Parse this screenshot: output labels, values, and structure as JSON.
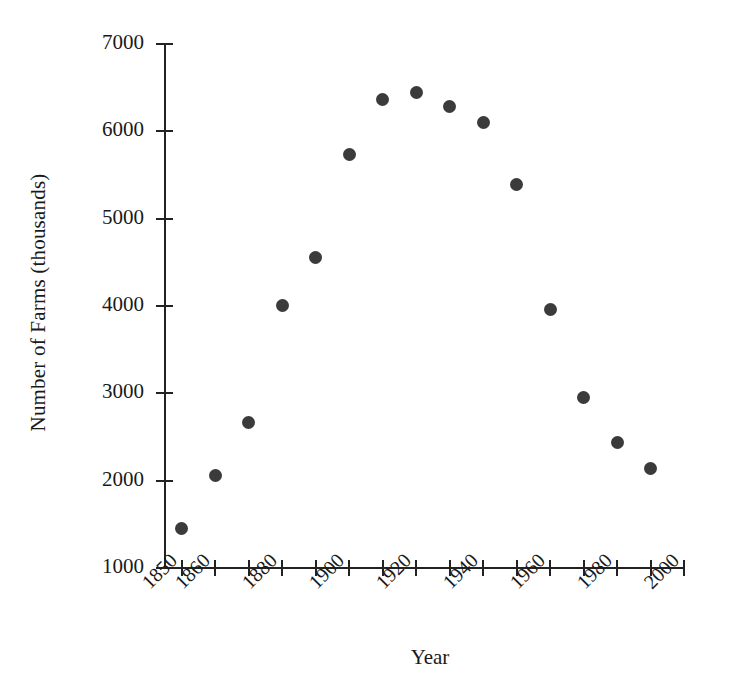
{
  "chart_data": {
    "type": "scatter",
    "title": "",
    "xlabel": "Year",
    "ylabel": "Number of Farms (thousands)",
    "xlim": [
      1845,
      2000
    ],
    "ylim": [
      1000,
      7000
    ],
    "grid": false,
    "legend": "none",
    "marker_color": "#3b3b3b",
    "axis_color": "#222222",
    "background_color": "#ffffff",
    "x": [
      1850,
      1860,
      1870,
      1880,
      1890,
      1900,
      1910,
      1920,
      1930,
      1940,
      1950,
      1960,
      1970,
      1980,
      1990
    ],
    "values": [
      1450,
      2060,
      2670,
      4010,
      4560,
      5740,
      6370,
      6450,
      6290,
      6100,
      5390,
      3960,
      2950,
      2440,
      2140
    ],
    "series": [
      {
        "name": "Number of Farms",
        "values": [
          1450,
          2060,
          2670,
          4010,
          4560,
          5740,
          6370,
          6450,
          6290,
          6100,
          5390,
          3960,
          2950,
          2440,
          2140
        ]
      }
    ],
    "points": [
      {
        "year": 1850,
        "farms": 1450
      },
      {
        "year": 1860,
        "farms": 2060
      },
      {
        "year": 1870,
        "farms": 2670
      },
      {
        "year": 1880,
        "farms": 4010
      },
      {
        "year": 1890,
        "farms": 4560
      },
      {
        "year": 1900,
        "farms": 5740
      },
      {
        "year": 1910,
        "farms": 6370
      },
      {
        "year": 1920,
        "farms": 6450
      },
      {
        "year": 1930,
        "farms": 6290
      },
      {
        "year": 1940,
        "farms": 6100
      },
      {
        "year": 1950,
        "farms": 5390
      },
      {
        "year": 1960,
        "farms": 3960
      },
      {
        "year": 1970,
        "farms": 2950
      },
      {
        "year": 1980,
        "farms": 2440
      },
      {
        "year": 1990,
        "farms": 2140
      }
    ],
    "yticks": [
      {
        "value": 7000,
        "label": "7000"
      },
      {
        "value": 6000,
        "label": "6000"
      },
      {
        "value": 5000,
        "label": "5000"
      },
      {
        "value": 4000,
        "label": "4000"
      },
      {
        "value": 3000,
        "label": "3000"
      },
      {
        "value": 2000,
        "label": "2000"
      },
      {
        "value": 1000,
        "label": "1000"
      }
    ],
    "xticks": [
      {
        "value": 1850,
        "label": "1850"
      },
      {
        "value": 1860,
        "label": "1860"
      },
      {
        "value": 1870,
        "label": ""
      },
      {
        "value": 1880,
        "label": "1880"
      },
      {
        "value": 1890,
        "label": ""
      },
      {
        "value": 1900,
        "label": "1900"
      },
      {
        "value": 1910,
        "label": ""
      },
      {
        "value": 1920,
        "label": "1920"
      },
      {
        "value": 1930,
        "label": ""
      },
      {
        "value": 1940,
        "label": "1940"
      },
      {
        "value": 1950,
        "label": ""
      },
      {
        "value": 1960,
        "label": "1960"
      },
      {
        "value": 1970,
        "label": ""
      },
      {
        "value": 1980,
        "label": "1980"
      },
      {
        "value": 1990,
        "label": ""
      },
      {
        "value": 2000,
        "label": "2000"
      }
    ]
  }
}
